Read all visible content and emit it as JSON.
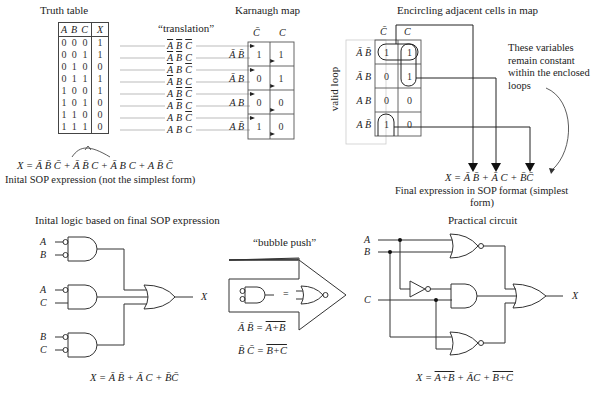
{
  "truth_table": {
    "title": "Truth table",
    "headers": [
      "A",
      "B",
      "C",
      "X"
    ],
    "rows": [
      [
        "0",
        "0",
        "0",
        "1"
      ],
      [
        "0",
        "0",
        "1",
        "1"
      ],
      [
        "0",
        "1",
        "0",
        "0"
      ],
      [
        "0",
        "1",
        "1",
        "1"
      ],
      [
        "1",
        "0",
        "0",
        "1"
      ],
      [
        "1",
        "0",
        "1",
        "0"
      ],
      [
        "1",
        "1",
        "0",
        "0"
      ],
      [
        "1",
        "1",
        "1",
        "0"
      ]
    ]
  },
  "translation": {
    "label": "“translation”",
    "terms": [
      {
        "A": "A",
        "A_bar": true,
        "B": "B",
        "B_bar": true,
        "C": "C",
        "C_bar": true
      },
      {
        "A": "A",
        "A_bar": true,
        "B": "B",
        "B_bar": true,
        "C": "C",
        "C_bar": false
      },
      {
        "A": "A",
        "A_bar": true,
        "B": "B",
        "B_bar": false,
        "C": "C",
        "C_bar": true
      },
      {
        "A": "A",
        "A_bar": true,
        "B": "B",
        "B_bar": false,
        "C": "C",
        "C_bar": false
      },
      {
        "A": "A",
        "A_bar": false,
        "B": "B",
        "B_bar": true,
        "C": "C",
        "C_bar": true
      },
      {
        "A": "A",
        "A_bar": false,
        "B": "B",
        "B_bar": true,
        "C": "C",
        "C_bar": false
      },
      {
        "A": "A",
        "A_bar": false,
        "B": "B",
        "B_bar": false,
        "C": "C",
        "C_bar": true
      },
      {
        "A": "A",
        "A_bar": false,
        "B": "B",
        "B_bar": false,
        "C": "C",
        "C_bar": false
      }
    ]
  },
  "karnaugh_map": {
    "title": "Karnaugh map",
    "col_headers": [
      "C̄",
      "C"
    ],
    "row_headers": [
      "Ā B̄",
      "Ā B",
      "A B",
      "A B̄"
    ],
    "cells": [
      [
        "1",
        "1"
      ],
      [
        "0",
        "1"
      ],
      [
        "0",
        "0"
      ],
      [
        "1",
        "0"
      ]
    ]
  },
  "encircling": {
    "title": "Encircling adjacent cells in map",
    "side_label": "valid loop",
    "col_headers": [
      "C̄",
      "C"
    ],
    "row_headers": [
      "Ā B̄",
      "Ā B",
      "A B",
      "A B̄"
    ],
    "cells": [
      [
        "1",
        "1"
      ],
      [
        "0",
        "1"
      ],
      [
        "0",
        "0"
      ],
      [
        "1",
        "0"
      ]
    ],
    "note_lines": [
      "These variables",
      "remain constant",
      "within the enclosed",
      "loops"
    ],
    "final_expr": "X = Ā B̄ + Ā C + B̄C̄",
    "final_caption_line1": "Final expression in SOP format (simplest",
    "final_caption_line2": "form)"
  },
  "initial_sop": {
    "expr": "X = Ā B̄ C̄ + Ā B̄ C + Ā B C + A B̄ C̄",
    "caption": "Inital SOP expression (not the simplest form)"
  },
  "initial_logic": {
    "title": "Inital logic based on final SOP expression",
    "inputs": [
      [
        "A",
        "B"
      ],
      [
        "A",
        "C"
      ],
      [
        "B",
        "C"
      ]
    ],
    "output": "X",
    "expr": "X = Ā B̄ + Ā C + B̄C̄"
  },
  "bubble_push": {
    "title": "“bubble push”",
    "equals": "=",
    "eq1": "Ā B̄ = A+B (overbar)",
    "eq1_lhs": "Ā B̄ =",
    "eq1_rhs": "A+B",
    "eq2_lhs": "B̄ C̄ =",
    "eq2_rhs": "B+C"
  },
  "practical": {
    "title": "Practical circuit",
    "inputs": [
      "A",
      "B",
      "C"
    ],
    "output": "X",
    "expr_prefix": "X =",
    "expr_t1": "A+B",
    "expr_plus1": "+",
    "expr_t2": "ĀC",
    "expr_plus2": "+",
    "expr_t3": "B+C"
  },
  "colors": {
    "line": "#222222",
    "grid_gray": "#999999",
    "text": "#222222"
  }
}
